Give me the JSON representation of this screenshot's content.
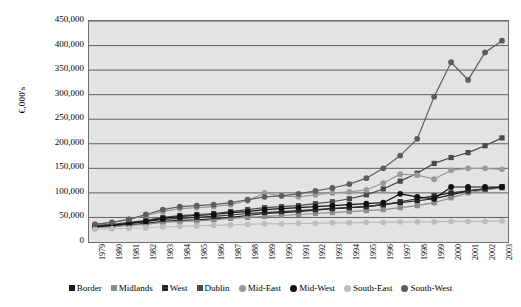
{
  "chart_data": {
    "type": "line",
    "title": "",
    "xlabel": "",
    "ylabel": "€,000's",
    "ylim": [
      0,
      450000
    ],
    "ytick_step": 50000,
    "grid": true,
    "legend_position": "bottom",
    "plot_background": "#e3e3e3",
    "ytick_labels": [
      "450,000",
      "400,000",
      "350,000",
      "300,000",
      "250,000",
      "200,000",
      "150,000",
      "100,000",
      "50,000",
      "0"
    ],
    "categories": [
      "1979",
      "1980",
      "1981",
      "1982",
      "1983",
      "1984",
      "1985",
      "1986",
      "1987",
      "1988",
      "1989",
      "1990",
      "1991",
      "1992",
      "1993",
      "1994",
      "1995",
      "1996",
      "1997",
      "1998",
      "1999",
      "2000",
      "2001",
      "2002",
      "2003"
    ],
    "series": [
      {
        "name": "Border",
        "color": "#1a1a1a",
        "marker": "square",
        "values": [
          30000,
          32000,
          35000,
          38000,
          42000,
          44000,
          45000,
          47000,
          50000,
          54000,
          58000,
          60000,
          62000,
          65000,
          68000,
          70000,
          72000,
          76000,
          80000,
          84000,
          88000,
          96000,
          104000,
          108000,
          112000
        ]
      },
      {
        "name": "Midlands",
        "color": "#8c8c8c",
        "marker": "square",
        "values": [
          30000,
          32000,
          34000,
          36000,
          40000,
          42000,
          43000,
          45000,
          48000,
          50000,
          52000,
          54000,
          56000,
          58000,
          60000,
          62000,
          64000,
          66000,
          70000,
          74000,
          80000,
          90000,
          100000,
          106000,
          110000
        ]
      },
      {
        "name": "West",
        "color": "#2b2b2b",
        "marker": "square",
        "values": [
          32000,
          34000,
          38000,
          42000,
          46000,
          48000,
          50000,
          52000,
          55000,
          58000,
          60000,
          62000,
          64000,
          66000,
          68000,
          70000,
          72000,
          76000,
          82000,
          88000,
          94000,
          100000,
          104000,
          108000,
          112000
        ]
      },
      {
        "name": "Dublin",
        "color": "#4a4a4a",
        "marker": "square",
        "values": [
          34000,
          36000,
          40000,
          44000,
          50000,
          54000,
          56000,
          58000,
          62000,
          66000,
          70000,
          72000,
          74000,
          78000,
          82000,
          88000,
          96000,
          108000,
          124000,
          140000,
          160000,
          172000,
          182000,
          196000,
          212000
        ]
      },
      {
        "name": "Mid-East",
        "color": "#9a9a9a",
        "marker": "circle",
        "values": [
          36000,
          40000,
          46000,
          54000,
          62000,
          68000,
          70000,
          72000,
          76000,
          84000,
          100000,
          94000,
          92000,
          96000,
          100000,
          102000,
          106000,
          120000,
          138000,
          136000,
          128000,
          146000,
          150000,
          150000,
          148000
        ]
      },
      {
        "name": "Mid-West",
        "color": "#111111",
        "marker": "circle",
        "values": [
          32000,
          34000,
          38000,
          42000,
          48000,
          52000,
          54000,
          56000,
          60000,
          62000,
          66000,
          68000,
          70000,
          72000,
          74000,
          76000,
          78000,
          80000,
          98000,
          92000,
          88000,
          112000,
          112000,
          112000,
          112000
        ]
      },
      {
        "name": "South-East",
        "color": "#bdbdbd",
        "marker": "circle",
        "values": [
          26000,
          27000,
          28000,
          29000,
          31000,
          32000,
          33000,
          34000,
          35000,
          36000,
          37000,
          37000,
          38000,
          38000,
          39000,
          39000,
          40000,
          40000,
          41000,
          41000,
          41000,
          42000,
          42000,
          42000,
          43000
        ]
      },
      {
        "name": "South-West",
        "color": "#5d5d5d",
        "marker": "circle",
        "values": [
          36000,
          40000,
          46000,
          56000,
          66000,
          72000,
          74000,
          76000,
          80000,
          86000,
          92000,
          94000,
          98000,
          104000,
          110000,
          118000,
          130000,
          150000,
          176000,
          210000,
          296000,
          366000,
          330000,
          386000,
          410000
        ]
      }
    ]
  }
}
